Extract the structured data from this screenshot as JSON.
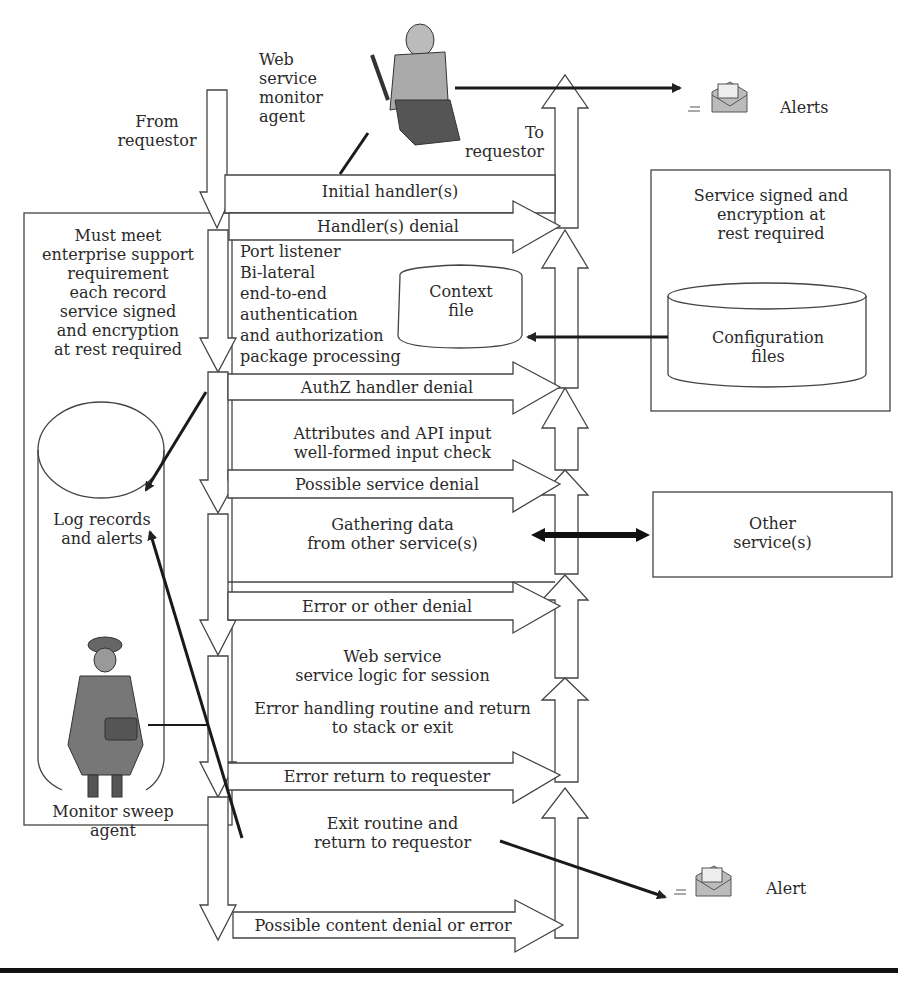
{
  "colors": {
    "line": "#333333",
    "stroke": "#444444",
    "background": "#ffffff",
    "figure_fill": "#8a8a8a"
  },
  "labels": {
    "from_requestor": [
      "From",
      "requestor"
    ],
    "web_service_monitor_agent": [
      "Web",
      "service",
      "monitor",
      "agent"
    ],
    "to_requestor": [
      "To",
      "requestor"
    ],
    "alerts": "Alerts",
    "alert": "Alert",
    "enterprise_requirement": [
      "Must meet",
      "enterprise support",
      "requirement",
      "each record",
      "service signed",
      "and encryption",
      "at rest required"
    ],
    "service_signed": [
      "Service signed and",
      "encryption at",
      "rest required"
    ],
    "configuration_files": [
      "Configuration",
      "files"
    ],
    "context_file": [
      "Context",
      "file"
    ],
    "port_listener": [
      "Port listener",
      "Bi-lateral",
      "end-to-end",
      "authentication",
      "and authorization",
      "package processing"
    ],
    "log_records": [
      "Log records",
      "and alerts"
    ],
    "monitor_sweep_agent": [
      "Monitor sweep",
      "agent"
    ],
    "other_services": [
      "Other",
      "service(s)"
    ],
    "attributes_check": [
      "Attributes and API input",
      "well-formed input check"
    ],
    "gathering_data": [
      "Gathering data",
      "from other service(s)"
    ],
    "web_service_logic": [
      "Web service",
      "service logic for session"
    ],
    "error_handling": [
      "Error handling routine and return",
      "to stack or exit"
    ],
    "exit_routine": [
      "Exit routine and",
      "return to requestor"
    ]
  },
  "flow_arrows": [
    {
      "label": "Initial handler(s)"
    },
    {
      "label": "Handler(s) denial"
    },
    {
      "label": "AuthZ handler denial"
    },
    {
      "label": "Possible service denial"
    },
    {
      "label": "Error or other denial"
    },
    {
      "label": "Error return to requester"
    },
    {
      "label": "Possible content denial or error"
    }
  ],
  "icons": {
    "monitor_agent": "person-with-tool-icon",
    "sweep_agent": "detective-icon",
    "alerts_envelope": "mail-envelope-icon",
    "alert_envelope": "mail-envelope-icon"
  }
}
